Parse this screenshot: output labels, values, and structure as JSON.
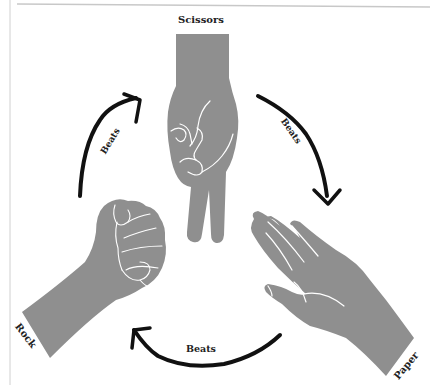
{
  "diagram": {
    "nodes": [
      {
        "id": "scissors",
        "label": "Scissors",
        "icon": "scissors-hand-icon"
      },
      {
        "id": "paper",
        "label": "Paper",
        "icon": "open-hand-icon"
      },
      {
        "id": "rock",
        "label": "Rock",
        "icon": "fist-icon"
      }
    ],
    "edges": [
      {
        "from": "rock",
        "to": "scissors",
        "label": "Beats"
      },
      {
        "from": "scissors",
        "to": "paper",
        "label": "Beats"
      },
      {
        "from": "paper",
        "to": "rock",
        "label": "Beats"
      }
    ],
    "colors": {
      "hand_fill": "#8f8f8f",
      "hand_lines": "#ffffff",
      "arrow": "#111111",
      "border": "#cccccc"
    }
  }
}
